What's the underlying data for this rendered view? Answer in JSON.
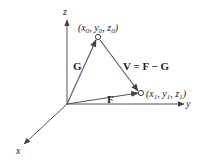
{
  "diagram": {
    "type": "3d-vector-diagram",
    "axes": {
      "x": {
        "label": "x"
      },
      "y": {
        "label": "y"
      },
      "z": {
        "label": "z"
      }
    },
    "points": [
      {
        "id": "P0",
        "label_parts": [
          "(x",
          "0",
          ", y",
          "0",
          ", z",
          "0",
          ")"
        ]
      },
      {
        "id": "P1",
        "label_parts": [
          "(x",
          "1",
          ", y",
          "1",
          ", z",
          "1",
          ")"
        ]
      }
    ],
    "vectors": [
      {
        "id": "G",
        "label": "G",
        "from": "origin",
        "to": "P0"
      },
      {
        "id": "F",
        "label": "F",
        "from": "origin",
        "to": "P1"
      },
      {
        "id": "V",
        "label": "V = F − G",
        "from": "P0",
        "to": "P1"
      }
    ],
    "colors": {
      "line": "#555555",
      "text": "#222222",
      "background": "#ffffff"
    }
  }
}
